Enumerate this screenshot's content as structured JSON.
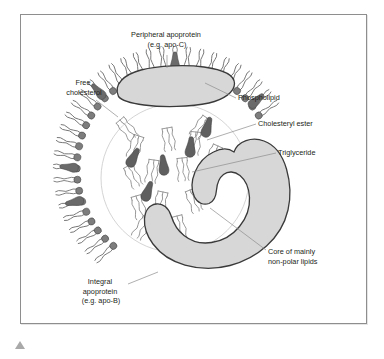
{
  "figure": {
    "frame": {
      "visible": true
    },
    "nav_marker": "triangle-up-marker"
  },
  "colors": {
    "frame_border": "#8e8e8e",
    "page_background": "#ffffff",
    "protein_fill": "#d7d7d7",
    "protein_stroke": "#3a3a3a",
    "phospholipid_head": "#7d7d7d",
    "phospholipid_tail": "#6e6e6e",
    "cholesterol": "#6a6a6a",
    "cholesteryl_ester": "#5f5f5f",
    "triglyceride_stroke": "#8a8a8a",
    "core_circle": "#c9c9c9",
    "leader_line": "#8c8c8c",
    "label_text": "#231f20"
  },
  "labels": [
    {
      "id": "peripheral-apoprotein",
      "lines": [
        "Peripheral apoprotein",
        "(e.g. apo-C)"
      ],
      "line1": "Peripheral apoprotein",
      "line2": "(e.g. apo-C)",
      "anchor": "middle",
      "x": 167,
      "y": 45
    },
    {
      "id": "free-cholesterol",
      "lines": [
        "Free",
        "cholesterol"
      ],
      "line1": "Free",
      "line2": "cholesterol",
      "anchor": "middle",
      "x": 84,
      "y": 93
    },
    {
      "id": "phospholipid",
      "lines": [
        "Phospholipid"
      ],
      "line1": "Phospholipid",
      "anchor": "start",
      "x": 238,
      "y": 100
    },
    {
      "id": "cholesteryl-ester",
      "lines": [
        "Cholesteryl ester"
      ],
      "line1": "Cholesteryl ester",
      "anchor": "start",
      "x": 258,
      "y": 126
    },
    {
      "id": "triglyceride",
      "lines": [
        "Triglyceride"
      ],
      "line1": "Triglyceride",
      "anchor": "start",
      "x": 278,
      "y": 155
    },
    {
      "id": "core-of-mainly-non-polar-lipids",
      "lines": [
        "Core of mainly",
        "non-polar lipids"
      ],
      "line1": "Core of mainly",
      "line2": "non-polar lipids",
      "anchor": "start",
      "x": 268,
      "y": 254
    },
    {
      "id": "integral-apoprotein",
      "lines": [
        "Integral",
        "apoprotein",
        "(e.g. apo-B)"
      ],
      "line1": "Integral",
      "line2": "apoprotein",
      "line3": "(e.g. apo-B)",
      "anchor": "middle",
      "x": 101,
      "y": 287
    }
  ],
  "structures": {
    "peripheral_apoprotein": "lens-shaped gray blob sitting on top of the phospholipid monolayer",
    "integral_apoprotein": "long snaking gray band threading through the right and lower part of the particle",
    "phospholipid_monolayer": "ring of circular heads with two wavy tails pointing into the core",
    "free_cholesterol": "pear/teardrop shapes embedded among the phospholipids",
    "cholesteryl_ester": "dark teardrop shapes inside the core",
    "triglyceride": "three-tailed squiggle glyphs inside the core",
    "core": "faint circle marking the non-polar lipid core"
  }
}
